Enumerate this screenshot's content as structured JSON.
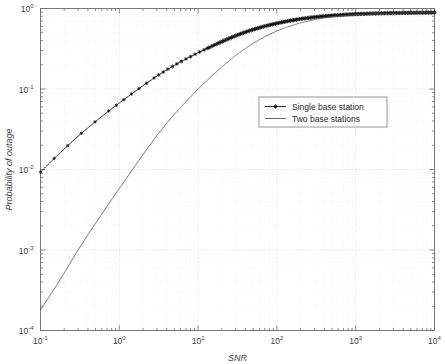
{
  "chart_data": {
    "type": "line",
    "title": "",
    "xlabel": "SNR",
    "ylabel": "Probability of outage",
    "xscale": "log",
    "yscale": "log",
    "xlim": [
      0.1,
      10000
    ],
    "ylim": [
      0.0001,
      1
    ],
    "grid": true,
    "legend_position": "center-right",
    "xticks": [
      {
        "value": 0.1,
        "mantissa": "10",
        "exponent": "-1"
      },
      {
        "value": 1,
        "mantissa": "10",
        "exponent": "0"
      },
      {
        "value": 10,
        "mantissa": "10",
        "exponent": "1"
      },
      {
        "value": 100,
        "mantissa": "10",
        "exponent": "2"
      },
      {
        "value": 1000,
        "mantissa": "10",
        "exponent": "3"
      },
      {
        "value": 10000,
        "mantissa": "10",
        "exponent": "4"
      }
    ],
    "yticks": [
      {
        "value": 1,
        "mantissa": "10",
        "exponent": "0"
      },
      {
        "value": 0.1,
        "mantissa": "10",
        "exponent": "-1"
      },
      {
        "value": 0.01,
        "mantissa": "10",
        "exponent": "-2"
      },
      {
        "value": 0.001,
        "mantissa": "10",
        "exponent": "-3"
      },
      {
        "value": 0.0001,
        "mantissa": "10",
        "exponent": "-4"
      }
    ],
    "series": [
      {
        "name": "Single base station",
        "marker": "star",
        "color": "#111111",
        "x": [
          0.1,
          0.15,
          0.2,
          0.3,
          0.4,
          0.5,
          0.7,
          1.0,
          1.4,
          2.0,
          3.0,
          4.0,
          5.0,
          7.0,
          10,
          14,
          20,
          30,
          40,
          50,
          70,
          100,
          140,
          200,
          300,
          400,
          500,
          700,
          1000,
          1400,
          2000,
          3000,
          4000,
          5000,
          7000,
          10000
        ],
        "y": [
          0.0093,
          0.0138,
          0.018,
          0.026,
          0.033,
          0.0395,
          0.0515,
          0.067,
          0.0855,
          0.11,
          0.145,
          0.173,
          0.197,
          0.236,
          0.283,
          0.33,
          0.388,
          0.46,
          0.51,
          0.548,
          0.603,
          0.655,
          0.7,
          0.742,
          0.782,
          0.803,
          0.818,
          0.836,
          0.852,
          0.862,
          0.87,
          0.878,
          0.882,
          0.885,
          0.888,
          0.89
        ]
      },
      {
        "name": "Two base stations",
        "marker": "none",
        "color": "#555555",
        "x": [
          0.1,
          0.15,
          0.2,
          0.3,
          0.4,
          0.5,
          0.7,
          1.0,
          1.4,
          2.0,
          3.0,
          4.0,
          5.0,
          7.0,
          10,
          14,
          20,
          30,
          40,
          50,
          70,
          100,
          140,
          200,
          300,
          400,
          500,
          700,
          1000,
          1400,
          2000,
          3000,
          4000,
          5000,
          7000,
          10000
        ],
        "y": [
          0.00018,
          0.00033,
          0.00052,
          0.001,
          0.00155,
          0.00215,
          0.0035,
          0.0058,
          0.0093,
          0.0154,
          0.0265,
          0.0375,
          0.0485,
          0.0695,
          0.1,
          0.137,
          0.188,
          0.262,
          0.32,
          0.37,
          0.447,
          0.525,
          0.597,
          0.663,
          0.728,
          0.765,
          0.789,
          0.818,
          0.84,
          0.855,
          0.866,
          0.875,
          0.88,
          0.883,
          0.886,
          0.888
        ]
      }
    ],
    "legend": [
      {
        "label": "Single base station",
        "marker": "star"
      },
      {
        "label": "Two base stations",
        "marker": "none"
      }
    ]
  }
}
